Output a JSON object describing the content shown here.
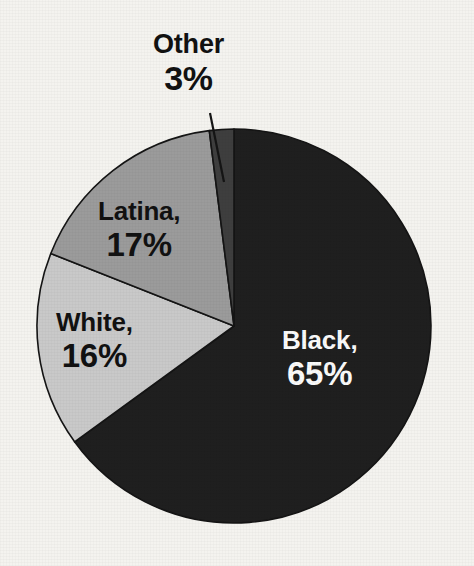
{
  "chart_data": {
    "type": "pie",
    "title": "",
    "subtitle": "",
    "xlabel": "",
    "ylabel": "",
    "legend_position": "none",
    "grid": false,
    "labels_inline": true,
    "total_percent": 101,
    "categories": [
      "Black",
      "White",
      "Latina",
      "Other"
    ],
    "values": [
      65,
      16,
      17,
      3
    ],
    "slices": [
      {
        "name": "Black",
        "label": "Black,",
        "value": 65,
        "value_label": "65%",
        "color": "#1f1f1f",
        "text_color": "#fafafa",
        "start_angle": 0,
        "end_angle": 234,
        "label_placement": "inside"
      },
      {
        "name": "White",
        "label": "White,",
        "value": 16,
        "value_label": "16%",
        "color": "#c9c9c9",
        "text_color": "#111111",
        "start_angle": 234,
        "end_angle": 291.6,
        "label_placement": "inside"
      },
      {
        "name": "Latina",
        "label": "Latina,",
        "value": 17,
        "value_label": "17%",
        "color": "#9b9b9b",
        "text_color": "#111111",
        "start_angle": 291.6,
        "end_angle": 352.8,
        "label_placement": "inside"
      },
      {
        "name": "Other",
        "label": "Other",
        "value": 3,
        "value_label": "3%",
        "color": "#3e3e3e",
        "text_color": "#111111",
        "start_angle": 352.8,
        "end_angle": 360,
        "label_placement": "outside-callout"
      }
    ]
  },
  "figure": {
    "background_color": "#f4f3ef",
    "outline_color": "#141414",
    "center_x": 234,
    "center_y": 326,
    "radius": 197
  }
}
